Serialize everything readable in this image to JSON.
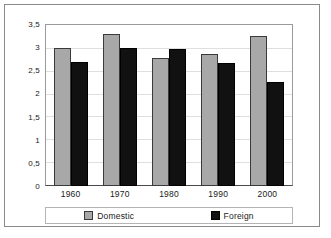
{
  "chart_data": {
    "type": "bar",
    "title": "",
    "xlabel": "",
    "ylabel": "",
    "categories": [
      "1960",
      "1970",
      "1980",
      "1990",
      "2000"
    ],
    "series": [
      {
        "name": "Domestic",
        "color": "#a8a8a8",
        "values": [
          3.0,
          3.3,
          2.78,
          2.86,
          3.26
        ]
      },
      {
        "name": "Foreign",
        "color": "#111111",
        "values": [
          2.7,
          3.0,
          2.98,
          2.68,
          2.27
        ]
      }
    ],
    "ylim": [
      0,
      3.5
    ],
    "yticks": [
      0,
      0.5,
      1,
      1.5,
      2,
      2.5,
      3,
      3.5
    ],
    "ytick_labels": [
      "0",
      "0,5",
      "1",
      "1,5",
      "2",
      "2,5",
      "3",
      "3,5"
    ],
    "decimal_separator": ",",
    "grid": true,
    "grid_axis": "y",
    "legend_position": "bottom",
    "legend_entries": [
      "Domestic",
      "Foreign"
    ]
  },
  "colors": {
    "domestic": "#a8a8a8",
    "foreign": "#111111",
    "frame": "#8a8a8a",
    "gridline": "#dfdfdf",
    "axis": "#4a4a4a"
  }
}
